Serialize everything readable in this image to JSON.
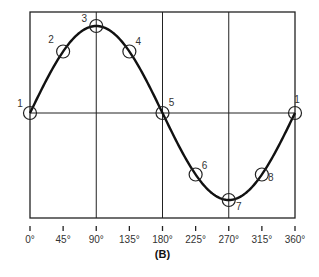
{
  "chart_data": {
    "type": "line",
    "title": "",
    "caption": "(B)",
    "xlabel": "",
    "ylabel": "",
    "x_ticks": [
      "0°",
      "45°",
      "90°",
      "135°",
      "180°",
      "225°",
      "270°",
      "315°",
      "360°"
    ],
    "x": [
      0,
      45,
      90,
      135,
      180,
      225,
      270,
      315,
      360
    ],
    "series": [
      {
        "name": "sine wave",
        "values": [
          0,
          0.707,
          1,
          0.707,
          0,
          -0.707,
          -1,
          -0.707,
          0
        ]
      }
    ],
    "points": [
      {
        "label": "1",
        "angle": 0,
        "value": 0
      },
      {
        "label": "2",
        "angle": 45,
        "value": 0.707
      },
      {
        "label": "3",
        "angle": 90,
        "value": 1
      },
      {
        "label": "4",
        "angle": 135,
        "value": 0.707
      },
      {
        "label": "5",
        "angle": 180,
        "value": 0
      },
      {
        "label": "6",
        "angle": 225,
        "value": -0.707
      },
      {
        "label": "7",
        "angle": 270,
        "value": -1
      },
      {
        "label": "8",
        "angle": 315,
        "value": -0.707
      },
      {
        "label": "1",
        "angle": 360,
        "value": 0
      }
    ],
    "xlim": [
      0,
      360
    ],
    "ylim": [
      -1.1,
      1.1
    ],
    "grid": true,
    "legend": null
  }
}
